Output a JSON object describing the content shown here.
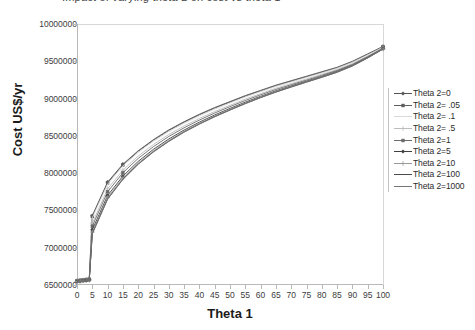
{
  "chart_data": {
    "type": "line",
    "title": "Impact of varying theta 2 on cost vs theta 1",
    "xlabel": "Theta 1",
    "ylabel": "Cost  US$/yr",
    "xlim": [
      0,
      100
    ],
    "ylim": [
      6500000,
      10000000
    ],
    "xticks": [
      0,
      5,
      10,
      15,
      20,
      25,
      30,
      35,
      40,
      45,
      50,
      55,
      60,
      65,
      70,
      75,
      80,
      85,
      90,
      95,
      100
    ],
    "yticks": [
      6500000,
      7000000,
      7500000,
      8000000,
      8500000,
      9000000,
      9500000,
      10000000
    ],
    "ytick_labels": [
      "6500000",
      "7000000",
      "7500000",
      "8000000",
      "8500000",
      "9000000",
      "9500000",
      "10000000"
    ],
    "xtick_labels": [
      "0",
      "5",
      "10",
      "15",
      "20",
      "25",
      "30",
      "35",
      "40",
      "45",
      "50",
      "55",
      "60",
      "65",
      "70",
      "75",
      "80",
      "85",
      "90",
      "95",
      "100"
    ],
    "grid": false,
    "legend_position": "right",
    "x": [
      0,
      1,
      2,
      3,
      4,
      5,
      10,
      15,
      20,
      25,
      30,
      35,
      40,
      45,
      50,
      55,
      60,
      65,
      70,
      75,
      80,
      85,
      90,
      95,
      100
    ],
    "series": [
      {
        "name": "Theta 2=0",
        "color": "#555555",
        "marker": "diamond",
        "values": [
          6560000,
          6565000,
          6570000,
          6575000,
          6580000,
          7430000,
          7880000,
          8120000,
          8300000,
          8450000,
          8580000,
          8690000,
          8790000,
          8880000,
          8960000,
          9040000,
          9110000,
          9180000,
          9240000,
          9300000,
          9360000,
          9420000,
          9500000,
          9600000,
          9700000
        ]
      },
      {
        "name": "Theta 2= .05",
        "color": "#5e5e5e",
        "marker": "square",
        "values": [
          6558000,
          6563000,
          6568000,
          6573000,
          6578000,
          7420000,
          7870000,
          8110000,
          8292000,
          8442000,
          8572000,
          8682000,
          8782000,
          8872000,
          8952000,
          9032000,
          9102000,
          9172000,
          9232000,
          9292000,
          9352000,
          9412000,
          9492000,
          9592000,
          9695000
        ]
      },
      {
        "name": "Theta 2= .1",
        "color": "#d9d9d9",
        "marker": "none",
        "values": [
          6555000,
          6560000,
          6565000,
          6570000,
          6575000,
          7400000,
          7850000,
          8095000,
          8278000,
          8428000,
          8558000,
          8668000,
          8768000,
          8858000,
          8940000,
          9020000,
          9092000,
          9162000,
          9222000,
          9282000,
          9342000,
          9405000,
          9485000,
          9585000,
          9690000
        ]
      },
      {
        "name": "Theta 2= .5",
        "color": "#bdbdbd",
        "marker": "plus",
        "values": [
          6552000,
          6557000,
          6562000,
          6567000,
          6572000,
          7330000,
          7790000,
          8040000,
          8230000,
          8385000,
          8518000,
          8632000,
          8734000,
          8826000,
          8910000,
          8992000,
          9066000,
          9138000,
          9200000,
          9262000,
          9324000,
          9388000,
          9468000,
          9570000,
          9680000
        ]
      },
      {
        "name": "Theta 2=1",
        "color": "#6b6b6b",
        "marker": "square",
        "values": [
          6550000,
          6555000,
          6560000,
          6565000,
          6570000,
          7290000,
          7750000,
          8005000,
          8198000,
          8356000,
          8492000,
          8608000,
          8712000,
          8806000,
          8892000,
          8974000,
          9050000,
          9122000,
          9186000,
          9248000,
          9312000,
          9378000,
          9458000,
          9562000,
          9675000
        ]
      },
      {
        "name": "Theta 2=5",
        "color": "#3f3f3f",
        "marker": "diamond",
        "values": [
          6548000,
          6553000,
          6558000,
          6562000,
          6568000,
          7240000,
          7700000,
          7960000,
          8158000,
          8320000,
          8458000,
          8578000,
          8684000,
          8780000,
          8868000,
          8952000,
          9030000,
          9104000,
          9170000,
          9234000,
          9298000,
          9366000,
          9448000,
          9554000,
          9670000
        ]
      },
      {
        "name": "Theta 2=10",
        "color": "#9a9a9a",
        "marker": "plus",
        "values": [
          6546000,
          6551000,
          6556000,
          6560000,
          6566000,
          7210000,
          7672000,
          7936000,
          8136000,
          8300000,
          8440000,
          8562000,
          8670000,
          8766000,
          8856000,
          8940000,
          9020000,
          9094000,
          9160000,
          9226000,
          9290000,
          9358000,
          9442000,
          9548000,
          9666000
        ]
      },
      {
        "name": "Theta 2=100",
        "color": "#4a4a4a",
        "marker": "none",
        "values": [
          6545000,
          6550000,
          6554000,
          6559000,
          6564000,
          7190000,
          7655000,
          7920000,
          8122000,
          8288000,
          8428000,
          8552000,
          8660000,
          8758000,
          8848000,
          8934000,
          9014000,
          9088000,
          9156000,
          9222000,
          9286000,
          9354000,
          9438000,
          9546000,
          9664000
        ]
      },
      {
        "name": "Theta 2=1000",
        "color": "#747474",
        "marker": "none",
        "values": [
          6544000,
          6549000,
          6553000,
          6558000,
          6563000,
          7185000,
          7650000,
          7915000,
          8118000,
          8284000,
          8425000,
          8549000,
          8657000,
          8755000,
          8845000,
          8931000,
          9012000,
          9086000,
          9154000,
          9220000,
          9284000,
          9352000,
          9436000,
          9545000,
          9663000
        ]
      }
    ]
  },
  "legend": {
    "items": [
      {
        "label": "Theta 2=0"
      },
      {
        "label": "Theta 2= .05"
      },
      {
        "label": "Theta 2= .1"
      },
      {
        "label": "Theta 2= .5"
      },
      {
        "label": "Theta 2=1"
      },
      {
        "label": "Theta 2=5"
      },
      {
        "label": "Theta 2=10"
      },
      {
        "label": "Theta 2=100"
      },
      {
        "label": "Theta 2=1000"
      }
    ]
  }
}
